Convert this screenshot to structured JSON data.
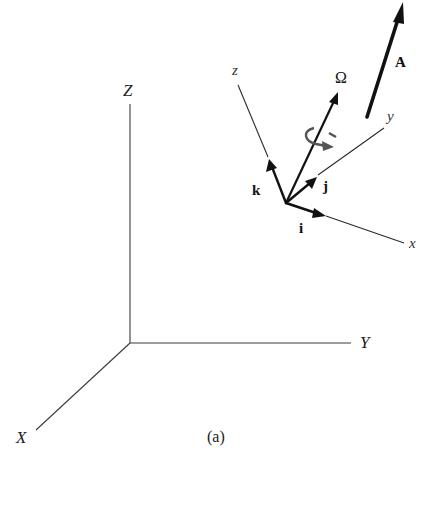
{
  "figure": {
    "caption": "(a)",
    "inertial_frame": {
      "axes": {
        "X": "X",
        "Y": "Y",
        "Z": "Z"
      }
    },
    "rotating_frame": {
      "axes": {
        "x": "x",
        "y": "y",
        "z": "z"
      },
      "unit_vectors": {
        "i": "i",
        "j": "j",
        "k": "k"
      },
      "angular_velocity": "Ω"
    },
    "vector": "A"
  }
}
